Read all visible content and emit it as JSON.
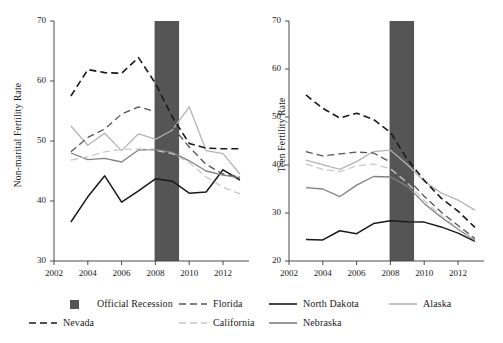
{
  "figure": {
    "background": "#ffffff",
    "recession_color": "#555555"
  },
  "chart_data": [
    {
      "type": "line",
      "id": "non-marital",
      "title": "",
      "xlabel": "",
      "ylabel": "Non-marital Fertility Rate",
      "xlim": [
        2002,
        2013.3
      ],
      "ylim": [
        30,
        70
      ],
      "yticks": [
        30,
        40,
        50,
        60,
        70
      ],
      "xticks": [
        2002,
        2004,
        2006,
        2008,
        2010,
        2012
      ],
      "grid": false,
      "legend_position": "below",
      "x": [
        2003,
        2004,
        2005,
        2006,
        2007,
        2008,
        2009,
        2010,
        2011,
        2012,
        2013
      ],
      "annotations": [
        {
          "name": "Official Recession",
          "type": "vspan",
          "x0": 2007.95,
          "x1": 2009.4,
          "color": "#555555"
        }
      ],
      "series": [
        {
          "name": "Nevada",
          "style": "dashed",
          "color": "#1a1a1a",
          "width": 1.6,
          "values": [
            57.5,
            61.9,
            61.4,
            61.3,
            63.9,
            59.6,
            54.0,
            49.6,
            48.8,
            48.7,
            48.7
          ]
        },
        {
          "name": "Florida",
          "style": "dashed",
          "color": "#555555",
          "width": 1.3,
          "values": [
            48.2,
            50.6,
            52.0,
            54.5,
            55.7,
            54.9,
            52.4,
            49.0,
            46.1,
            44.5,
            44.0
          ]
        },
        {
          "name": "Alaska",
          "style": "solid",
          "color": "#b4b4b4",
          "width": 1.3,
          "values": [
            52.5,
            49.3,
            51.3,
            48.4,
            51.2,
            50.3,
            51.8,
            55.7,
            48.4,
            47.9,
            44.5
          ]
        },
        {
          "name": "California",
          "style": "dashed",
          "color": "#c8c8c8",
          "width": 1.3,
          "values": [
            46.8,
            47.4,
            48.2,
            48.6,
            48.7,
            48.4,
            47.9,
            46.4,
            44.0,
            42.3,
            41.2
          ]
        },
        {
          "name": "Nebraska",
          "style": "solid",
          "color": "#808080",
          "width": 1.3,
          "values": [
            48.0,
            46.9,
            47.1,
            46.5,
            48.5,
            48.6,
            48.1,
            46.7,
            45.0,
            44.3,
            43.9
          ]
        },
        {
          "name": "North Dakota",
          "style": "solid",
          "color": "#1a1a1a",
          "width": 1.5,
          "values": [
            36.5,
            40.7,
            44.2,
            39.8,
            41.7,
            43.7,
            43.3,
            41.3,
            41.5,
            45.2,
            43.5
          ]
        }
      ]
    },
    {
      "type": "line",
      "id": "teen",
      "title": "",
      "xlabel": "",
      "ylabel": "Teen Fertility Rate",
      "xlim": [
        2002,
        2013.3
      ],
      "ylim": [
        20,
        70
      ],
      "yticks": [
        20,
        30,
        40,
        50,
        60,
        70
      ],
      "xticks": [
        2002,
        2004,
        2006,
        2008,
        2010,
        2012
      ],
      "grid": false,
      "legend_position": "below",
      "x": [
        2003,
        2004,
        2005,
        2006,
        2007,
        2008,
        2009,
        2010,
        2011,
        2012,
        2013
      ],
      "annotations": [
        {
          "name": "Official Recession",
          "type": "vspan",
          "x0": 2007.95,
          "x1": 2009.4,
          "color": "#555555"
        }
      ],
      "series": [
        {
          "name": "Nevada",
          "style": "dashed",
          "color": "#1a1a1a",
          "width": 1.6,
          "values": [
            54.6,
            51.8,
            49.8,
            50.8,
            49.5,
            46.8,
            41.2,
            36.8,
            33.1,
            30.4,
            27.0
          ]
        },
        {
          "name": "Florida",
          "style": "dashed",
          "color": "#555555",
          "width": 1.3,
          "values": [
            42.8,
            41.9,
            42.3,
            42.7,
            42.5,
            40.6,
            37.2,
            33.5,
            30.2,
            27.4,
            24.7
          ]
        },
        {
          "name": "Alaska",
          "style": "solid",
          "color": "#b4b4b4",
          "width": 1.3,
          "values": [
            41.0,
            40.1,
            39.1,
            40.7,
            42.8,
            43.1,
            40.1,
            36.6,
            34.2,
            32.7,
            30.6
          ]
        },
        {
          "name": "California",
          "style": "dashed",
          "color": "#c8c8c8",
          "width": 1.3,
          "values": [
            40.2,
            39.1,
            38.6,
            39.8,
            40.2,
            39.2,
            36.3,
            32.6,
            29.5,
            26.8,
            24.4
          ]
        },
        {
          "name": "Nebraska",
          "style": "solid",
          "color": "#808080",
          "width": 1.3,
          "values": [
            35.3,
            35.0,
            33.4,
            35.8,
            37.6,
            37.5,
            35.6,
            32.0,
            29.1,
            26.6,
            24.3
          ]
        },
        {
          "name": "North Dakota",
          "style": "solid",
          "color": "#1a1a1a",
          "width": 1.5,
          "values": [
            24.5,
            24.4,
            26.3,
            25.7,
            27.8,
            28.4,
            28.2,
            28.1,
            27.1,
            25.8,
            24.1
          ]
        }
      ]
    }
  ],
  "legend": {
    "rows": [
      [
        {
          "label": "Official Recession",
          "sample": "swatch",
          "color": "#555555"
        },
        {
          "label": "Florida",
          "sample": "dashed",
          "color": "#555555"
        },
        {
          "label": "North Dakota",
          "sample": "solid",
          "color": "#1a1a1a"
        },
        {
          "label": "Alaska",
          "sample": "solid",
          "color": "#b4b4b4"
        }
      ],
      [
        {
          "label": "Nevada",
          "sample": "dashed",
          "color": "#1a1a1a"
        },
        {
          "label": "California",
          "sample": "dashed",
          "color": "#c8c8c8"
        },
        {
          "label": "Nebraska",
          "sample": "solid",
          "color": "#808080"
        }
      ]
    ]
  }
}
